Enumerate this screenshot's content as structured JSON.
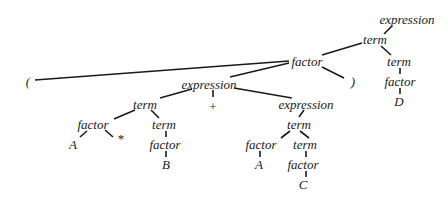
{
  "diagram": {
    "type": "parse-tree",
    "nodes": [
      {
        "id": "n0",
        "label": "expression",
        "x": 407,
        "y": 24
      },
      {
        "id": "n1",
        "label": "term",
        "x": 375,
        "y": 44
      },
      {
        "id": "n2",
        "label": "factor",
        "x": 307,
        "y": 66
      },
      {
        "id": "n3",
        "label": "term",
        "x": 399,
        "y": 66
      },
      {
        "id": "n4",
        "label": "factor",
        "x": 400,
        "y": 86
      },
      {
        "id": "n5",
        "label": "D",
        "x": 399,
        "y": 106
      },
      {
        "id": "n6",
        "label": "(",
        "x": 28,
        "y": 86
      },
      {
        "id": "n7",
        "label": ")",
        "x": 353,
        "y": 86
      },
      {
        "id": "n8",
        "label": "expression",
        "x": 209,
        "y": 89
      },
      {
        "id": "n9",
        "label": "+",
        "x": 213,
        "y": 111
      },
      {
        "id": "n10",
        "label": "term",
        "x": 145,
        "y": 109
      },
      {
        "id": "n11",
        "label": "expression",
        "x": 306,
        "y": 109
      },
      {
        "id": "n12",
        "label": "factor",
        "x": 93,
        "y": 129
      },
      {
        "id": "n13",
        "label": "*",
        "x": 121,
        "y": 143
      },
      {
        "id": "n14",
        "label": "term",
        "x": 164,
        "y": 129
      },
      {
        "id": "n15",
        "label": "A",
        "x": 73,
        "y": 149
      },
      {
        "id": "n16",
        "label": "factor",
        "x": 165,
        "y": 149
      },
      {
        "id": "n17",
        "label": "B",
        "x": 166,
        "y": 169
      },
      {
        "id": "n18",
        "label": "term",
        "x": 299,
        "y": 129
      },
      {
        "id": "n19",
        "label": "factor",
        "x": 261,
        "y": 149
      },
      {
        "id": "n20",
        "label": "term",
        "x": 305,
        "y": 149
      },
      {
        "id": "n21",
        "label": "A",
        "x": 259,
        "y": 169
      },
      {
        "id": "n22",
        "label": "factor",
        "x": 303,
        "y": 169
      },
      {
        "id": "n23",
        "label": "C",
        "x": 303,
        "y": 189
      }
    ],
    "edges": [
      {
        "from": "n0",
        "to": "n1",
        "x1": 392,
        "y1": 26,
        "x2": 384,
        "y2": 34
      },
      {
        "from": "n1",
        "to": "n2",
        "x1": 362,
        "y1": 43,
        "x2": 322,
        "y2": 55
      },
      {
        "from": "n1",
        "to": "n3",
        "x1": 381,
        "y1": 46,
        "x2": 391,
        "y2": 55
      },
      {
        "from": "n3",
        "to": "n4",
        "x1": 400,
        "y1": 68,
        "x2": 400,
        "y2": 74
      },
      {
        "from": "n4",
        "to": "n5",
        "x1": 400,
        "y1": 88,
        "x2": 400,
        "y2": 94
      },
      {
        "from": "n2",
        "to": "n6",
        "x1": 289,
        "y1": 61,
        "x2": 35,
        "y2": 80
      },
      {
        "from": "n2",
        "to": "n8",
        "x1": 289,
        "y1": 63,
        "x2": 230,
        "y2": 77
      },
      {
        "from": "n2",
        "to": "n7",
        "x1": 322,
        "y1": 67,
        "x2": 344,
        "y2": 78
      },
      {
        "from": "n8",
        "to": "n10",
        "x1": 192,
        "y1": 89,
        "x2": 160,
        "y2": 98
      },
      {
        "from": "n8",
        "to": "n9",
        "x1": 213,
        "y1": 90,
        "x2": 213,
        "y2": 97
      },
      {
        "from": "n8",
        "to": "n11",
        "x1": 234,
        "y1": 88,
        "x2": 292,
        "y2": 98
      },
      {
        "from": "n10",
        "to": "n12",
        "x1": 135,
        "y1": 110,
        "x2": 114,
        "y2": 119
      },
      {
        "from": "n10",
        "to": "n14",
        "x1": 151,
        "y1": 110,
        "x2": 159,
        "y2": 118
      },
      {
        "from": "n12",
        "to": "n15",
        "x1": 87,
        "y1": 131,
        "x2": 80,
        "y2": 137
      },
      {
        "from": "n12",
        "to": "n13",
        "x1": 105,
        "y1": 130,
        "x2": 113,
        "y2": 137
      },
      {
        "from": "n14",
        "to": "n16",
        "x1": 166,
        "y1": 131,
        "x2": 166,
        "y2": 137
      },
      {
        "from": "n16",
        "to": "n17",
        "x1": 166,
        "y1": 151,
        "x2": 166,
        "y2": 157
      },
      {
        "from": "n11",
        "to": "n18",
        "x1": 304,
        "y1": 110,
        "x2": 299,
        "y2": 117
      },
      {
        "from": "n18",
        "to": "n19",
        "x1": 290,
        "y1": 131,
        "x2": 281,
        "y2": 138
      },
      {
        "from": "n18",
        "to": "n20",
        "x1": 300,
        "y1": 131,
        "x2": 309,
        "y2": 138
      },
      {
        "from": "n19",
        "to": "n21",
        "x1": 260,
        "y1": 151,
        "x2": 260,
        "y2": 157
      },
      {
        "from": "n20",
        "to": "n22",
        "x1": 306,
        "y1": 151,
        "x2": 306,
        "y2": 157
      },
      {
        "from": "n22",
        "to": "n23",
        "x1": 306,
        "y1": 171,
        "x2": 306,
        "y2": 177
      }
    ]
  }
}
